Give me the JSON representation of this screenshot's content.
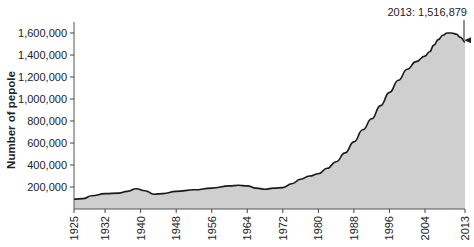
{
  "chart_data": {
    "type": "area",
    "title": "",
    "xlabel": "",
    "ylabel": "Number of pepole",
    "ylim": [
      0,
      1700000
    ],
    "xlim": [
      1925,
      2013
    ],
    "grid": false,
    "legend": null,
    "x_ticks": [
      "1925",
      "1932",
      "1940",
      "1948",
      "1956",
      "1964",
      "1972",
      "1980",
      "1988",
      "1996",
      "2004",
      "2013"
    ],
    "y_ticks": [
      {
        "value": 200000,
        "label": "200,000"
      },
      {
        "value": 400000,
        "label": "400,000"
      },
      {
        "value": 600000,
        "label": "600,000"
      },
      {
        "value": 800000,
        "label": "800,000"
      },
      {
        "value": 1000000,
        "label": "1,000,000"
      },
      {
        "value": 1200000,
        "label": "1,200,000"
      },
      {
        "value": 1400000,
        "label": "1,400,000"
      },
      {
        "value": 1600000,
        "label": "1,600,000"
      }
    ],
    "series": [
      {
        "name": "Number of people",
        "x": [
          1925,
          1927,
          1929,
          1932,
          1935,
          1937,
          1939,
          1941,
          1943,
          1945,
          1948,
          1952,
          1956,
          1960,
          1962,
          1964,
          1966,
          1968,
          1970,
          1972,
          1974,
          1976,
          1978,
          1980,
          1982,
          1984,
          1986,
          1988,
          1990,
          1992,
          1994,
          1996,
          1998,
          2000,
          2002,
          2004,
          2005,
          2006,
          2007,
          2008,
          2009,
          2010,
          2011,
          2012,
          2013
        ],
        "values": [
          90000,
          95000,
          120000,
          140000,
          145000,
          160000,
          185000,
          165000,
          135000,
          140000,
          160000,
          175000,
          190000,
          210000,
          215000,
          210000,
          190000,
          180000,
          190000,
          195000,
          230000,
          270000,
          300000,
          320000,
          370000,
          430000,
          510000,
          610000,
          720000,
          820000,
          940000,
          1060000,
          1170000,
          1270000,
          1340000,
          1390000,
          1430000,
          1490000,
          1540000,
          1580000,
          1600000,
          1600000,
          1590000,
          1560000,
          1516879
        ],
        "fill": "#cfcfcf",
        "line": "#1a1a1a"
      }
    ],
    "annotations": [
      {
        "x": 2013,
        "y": 1516879,
        "text": "2013: 1,516,879",
        "arrow": true
      }
    ]
  }
}
